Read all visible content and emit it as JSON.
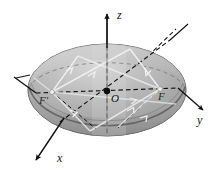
{
  "figure": {
    "kind": "3d-geometry-diagram",
    "background_color": "#ffffff"
  },
  "axes": [
    {
      "id": "z",
      "label": "z",
      "direction": "up",
      "style": "solid-with-arrow"
    },
    {
      "id": "y",
      "label": "y",
      "direction": "right",
      "style": "solid-with-arrow"
    },
    {
      "id": "x",
      "label": "x",
      "direction": "down-left",
      "style": "solid-with-arrow"
    }
  ],
  "points": [
    {
      "id": "origin",
      "label": "O",
      "marker": "filled-dot"
    },
    {
      "id": "focus-left",
      "label": "F′",
      "marker": "small-light-dot"
    },
    {
      "id": "focus-right",
      "label": "F",
      "marker": "small-light-dot"
    }
  ],
  "surface": {
    "shape": "oblate-ellipsoid",
    "fill_light": "#cfcfcf",
    "fill_mid": "#a8a8a8",
    "fill_dark": "#8a8a8a",
    "outline_color": "#4a4a4a",
    "equator_style": "dashed",
    "rim_style": "solid"
  },
  "rays": {
    "count": 6,
    "color": "#eeeeee",
    "arrow_style": "open-chevron",
    "description": "light rays from one focus reflecting off the ellipsoid surface to the other focus"
  },
  "dashed_lines": {
    "color": "#1a1a1a",
    "dash_pattern": "4 3",
    "description": "hidden major axis, minor axis and vertical axis segments inside the solid"
  }
}
